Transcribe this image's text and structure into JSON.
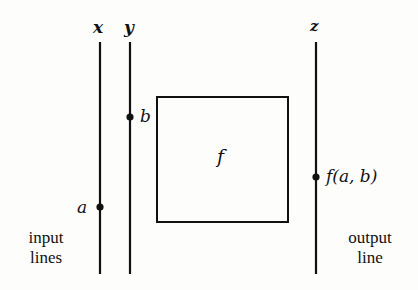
{
  "diagram": {
    "lines": [
      {
        "id": "x",
        "label": "x",
        "x": 100,
        "y1": 42,
        "y2": 274
      },
      {
        "id": "y",
        "label": "y",
        "x": 130,
        "y1": 42,
        "y2": 274
      },
      {
        "id": "z",
        "label": "z",
        "x": 316,
        "y1": 42,
        "y2": 274
      }
    ],
    "box": {
      "label": "f",
      "x": 157,
      "y": 97,
      "width": 131,
      "height": 125
    },
    "points": [
      {
        "line": "y",
        "label": "b",
        "y": 117
      },
      {
        "line": "x",
        "label": "a",
        "y": 207
      },
      {
        "line": "z",
        "label": "f(a, b)",
        "y": 177
      }
    ],
    "captions": {
      "input": [
        "input",
        "lines"
      ],
      "output": [
        "output",
        "line"
      ]
    },
    "colors": {
      "ink": "#111111",
      "paper": "#fdfdfb"
    }
  }
}
